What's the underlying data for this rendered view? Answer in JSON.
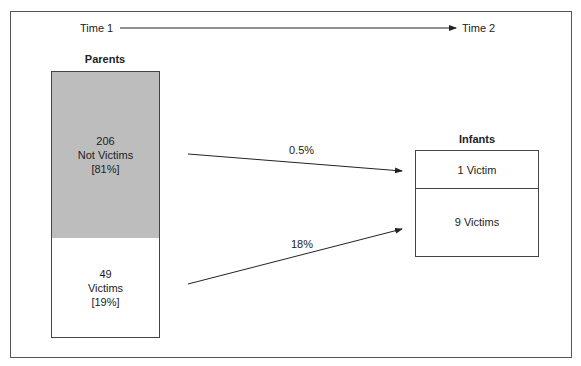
{
  "timeline": {
    "start_label": "Time 1",
    "end_label": "Time 2"
  },
  "parents": {
    "title": "Parents",
    "not_victims": {
      "count": "206",
      "label": "Not Victims",
      "percent": "[81%]",
      "fill": "#bdbdbd"
    },
    "victims": {
      "count": "49",
      "label": "Victims",
      "percent": "[19%]",
      "fill": "#ffffff"
    }
  },
  "arrows": [
    {
      "from": "parents-not-victims",
      "to": "infants-victim",
      "label": "0.5%"
    },
    {
      "from": "parents-victims",
      "to": "infants-victims",
      "label": "18%"
    }
  ],
  "infants": {
    "title": "Infants",
    "top": {
      "label": "1 Victim"
    },
    "bottom": {
      "label": "9 Victims"
    }
  }
}
